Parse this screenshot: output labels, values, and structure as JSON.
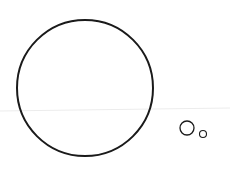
{
  "canvas": {
    "width": 230,
    "height": 173,
    "background": "#ffffff"
  },
  "colors": {
    "stroke": "#1a1a1a",
    "guide_line": "#ececec"
  },
  "guide_line": {
    "x1": 0,
    "y1": 111,
    "x2": 230,
    "y2": 108,
    "stroke_width": 1
  },
  "shapes": [
    {
      "name": "large-circle",
      "cx": 85,
      "cy": 88,
      "r": 68,
      "stroke_width": 2
    },
    {
      "name": "medium-small-circle",
      "cx": 187,
      "cy": 128,
      "r": 7,
      "stroke_width": 1.3
    },
    {
      "name": "tiny-circle",
      "cx": 203,
      "cy": 134,
      "r": 3.5,
      "stroke_width": 1.1
    }
  ]
}
